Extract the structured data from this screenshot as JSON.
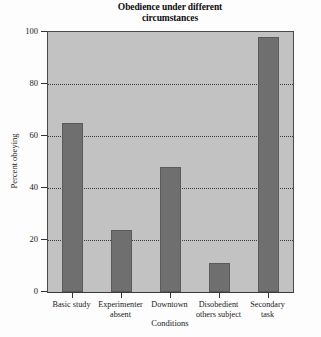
{
  "chart_data": {
    "type": "bar",
    "title": "Obedience under different circumstances",
    "title_line1": "Obedience under different",
    "title_line2": "circumstances",
    "xlabel": "Conditions",
    "ylabel": "Percent obeying",
    "categories": [
      "Basic study",
      "Experimenter absent",
      "Downtown",
      "Disobedient others subject",
      "Secondary task"
    ],
    "category_lines": [
      [
        "Basic study"
      ],
      [
        "Experimenter",
        "absent"
      ],
      [
        "Downtown"
      ],
      [
        "Disobedient",
        "others subject"
      ],
      [
        "Secondary",
        "task"
      ]
    ],
    "values": [
      65,
      24,
      48,
      11,
      98
    ],
    "ylim": [
      0,
      100
    ],
    "yticks": [
      0,
      20,
      40,
      60,
      80,
      100
    ],
    "ytick_labels": [
      "0",
      "20",
      "40",
      "60",
      "80",
      "100"
    ],
    "grid": true,
    "grid_axis": "y",
    "legend": "none",
    "colors": {
      "bar_fill": "#6f6f6f",
      "plot_background": "#c2c2c2",
      "figure_background": "#fdfdfd",
      "gridline": "#3c3c3c",
      "axis": "#333333",
      "text": "#1a1a1a"
    }
  }
}
